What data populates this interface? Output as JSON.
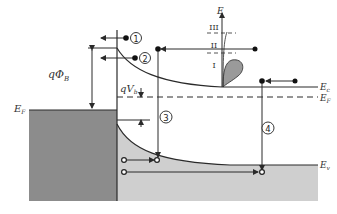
{
  "diagram": {
    "colors": {
      "metal_fill": "#8c8c8c",
      "valence_fill": "#cfcfcf",
      "line": "#2a2a2a",
      "distribution_fill": "#9a9a9a"
    },
    "labels": {
      "ef_metal": "E",
      "ef_metal_sub": "F",
      "ec": "E",
      "ec_sub": "c",
      "ef_semi": "E",
      "ef_semi_sub": "F",
      "ev": "E",
      "ev_sub": "v",
      "barrier": "qΦ",
      "barrier_sub": "B",
      "builtin": "qV",
      "builtin_sub": "b",
      "energy_axis": "E"
    },
    "mechanisms": [
      {
        "id": "1",
        "symbol": "①",
        "name": "thermionic emission over barrier"
      },
      {
        "id": "2",
        "symbol": "②",
        "name": "thermionic-field (tunneling) emission"
      },
      {
        "id": "3",
        "symbol": "③",
        "name": "recombination in depletion region"
      },
      {
        "id": "4",
        "symbol": "④",
        "name": "hole injection / recombination in neutral region"
      }
    ],
    "energy_regions": [
      "III",
      "II",
      "I"
    ]
  }
}
